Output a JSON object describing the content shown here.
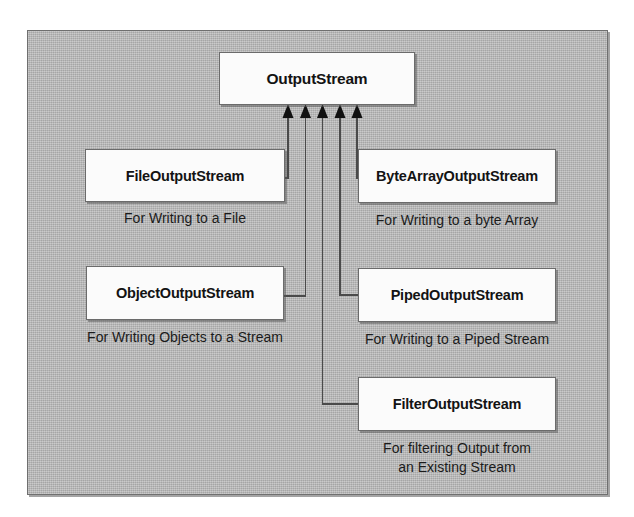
{
  "diagram": {
    "background_color": "#b6b6b6",
    "box_fill_color": "#fbfbfb",
    "box_border_color": "#6b6b6b",
    "text_color": "#131313",
    "root": {
      "name": "OutputStream"
    },
    "subclasses": [
      {
        "id": "file-output-stream",
        "name": "FileOutputStream",
        "caption": "For Writing to a File",
        "column": "left"
      },
      {
        "id": "byte-array-output-stream",
        "name": "ByteArrayOutputStream",
        "caption": "For Writing to a byte Array",
        "column": "right"
      },
      {
        "id": "object-output-stream",
        "name": "ObjectOutputStream",
        "caption": "For Writing Objects to a Stream",
        "column": "left"
      },
      {
        "id": "piped-output-stream",
        "name": "PipedOutputStream",
        "caption": "For Writing to a Piped Stream",
        "column": "right"
      },
      {
        "id": "filter-output-stream",
        "name": "FilterOutputStream",
        "caption_line1": "For filtering Output from",
        "caption_line2": "an Existing Stream",
        "column": "right"
      }
    ],
    "arrow_count": 5,
    "arrow_style": "solid-filled-triangle-inheritance"
  }
}
